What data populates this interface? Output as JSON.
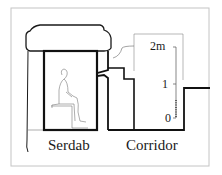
{
  "diagram": {
    "type": "architectural-cross-section",
    "labels": {
      "serdab": "Serdab",
      "corridor": "Corridor"
    },
    "scale": {
      "ticks": [
        {
          "label": "2m",
          "value": 2
        },
        {
          "label": "1",
          "value": 1
        },
        {
          "label": "0",
          "value": 0
        }
      ]
    },
    "colors": {
      "line": "#111111",
      "thin_line": "#555555",
      "frame": "#bdbdbd",
      "background": "#ffffff"
    }
  }
}
